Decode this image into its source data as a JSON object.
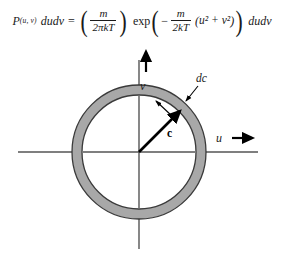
{
  "equation": {
    "lhs_symbol": "P",
    "lhs_subscript": "(u, v)",
    "lhs_differential": "dudv",
    "equals": "=",
    "prefactor": {
      "numerator": "m",
      "denominator": "2πkT"
    },
    "exp_label": "exp",
    "exp_minus": "−",
    "exp_fraction": {
      "numerator": "m",
      "denominator": "2kT"
    },
    "exp_argument_open": "(",
    "exp_argument": "u² + v²",
    "exp_argument_close": ")",
    "rhs_differential": "dudv",
    "open_paren": "(",
    "close_paren": ")",
    "full_text": "P(u, v) dudv = (m/2πkT) exp( − m/2kT (u² + v²) ) dudv"
  },
  "diagram": {
    "type": "velocity-space-annulus",
    "axes": {
      "vertical_label": "v",
      "horizontal_label": "u",
      "horizontal_arrow": "arrow-right",
      "vertical_arrow": "arrow-up"
    },
    "annulus": {
      "label": "dc",
      "fill_color": "#a8a8a8",
      "stroke_color": "#3a3a3a",
      "center": {
        "x": 139,
        "y": 110
      },
      "outer_radius": 67,
      "inner_radius": 57
    },
    "speed_vector": {
      "label": "c",
      "style": "bold",
      "angle_degrees": 45
    },
    "thickness_indicator": {
      "description": "small arrow marking annulus thickness dc"
    }
  },
  "colors": {
    "ink": "#1a1a1a",
    "ring_fill": "#a8a8a8",
    "ring_stroke": "#3a3a3a",
    "axis": "#555555",
    "background": "#ffffff"
  }
}
